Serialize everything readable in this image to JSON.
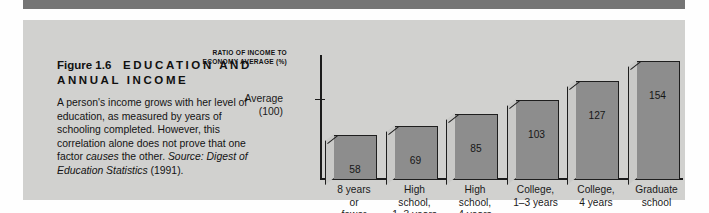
{
  "figure": {
    "label": "Figure 1.6",
    "title_plain": "EDUCATION AND ANNUAL INCOME",
    "caption_part1": "A person's income grows with her level of education, as measured by years of schooling completed. However, this correlation alone does not prove that one factor ",
    "caption_emphasis": "causes",
    "caption_part2": " the other. ",
    "caption_source_label": "Source: Digest of Education Statistics",
    "caption_year": " (1991)."
  },
  "chart_data": {
    "type": "bar",
    "ylabel": "RATIO OF INCOME TO ECONOMY AVERAGE (%)",
    "xlabel": "",
    "categories": [
      "8 years or fewer",
      "High school, 1–3 years",
      "High school, 4 years",
      "College, 1–3 years",
      "College, 4 years",
      "Graduate school"
    ],
    "category_lines": [
      [
        "8 years",
        "or",
        "fewer"
      ],
      [
        "High",
        "school,",
        "1–3 years"
      ],
      [
        "High",
        "school,",
        "4 years"
      ],
      [
        "College,",
        "1–3 years"
      ],
      [
        "College,",
        "4 years"
      ],
      [
        "Graduate",
        "school"
      ]
    ],
    "values": [
      58,
      69,
      85,
      103,
      127,
      154
    ],
    "reference_line": {
      "label_line1": "Average",
      "label_line2": "(100)",
      "value": 100
    },
    "ylim": [
      0,
      165
    ],
    "grid": false,
    "legend": false,
    "bar_color": "#8d8d8d",
    "bar_side_color": "#c9c9c7",
    "outline_color": "#1e1e1e"
  },
  "colors": {
    "panel_background": "#d1d1cf",
    "top_rule": "#757575",
    "page_background": "#fefefe",
    "text": "#141414"
  }
}
